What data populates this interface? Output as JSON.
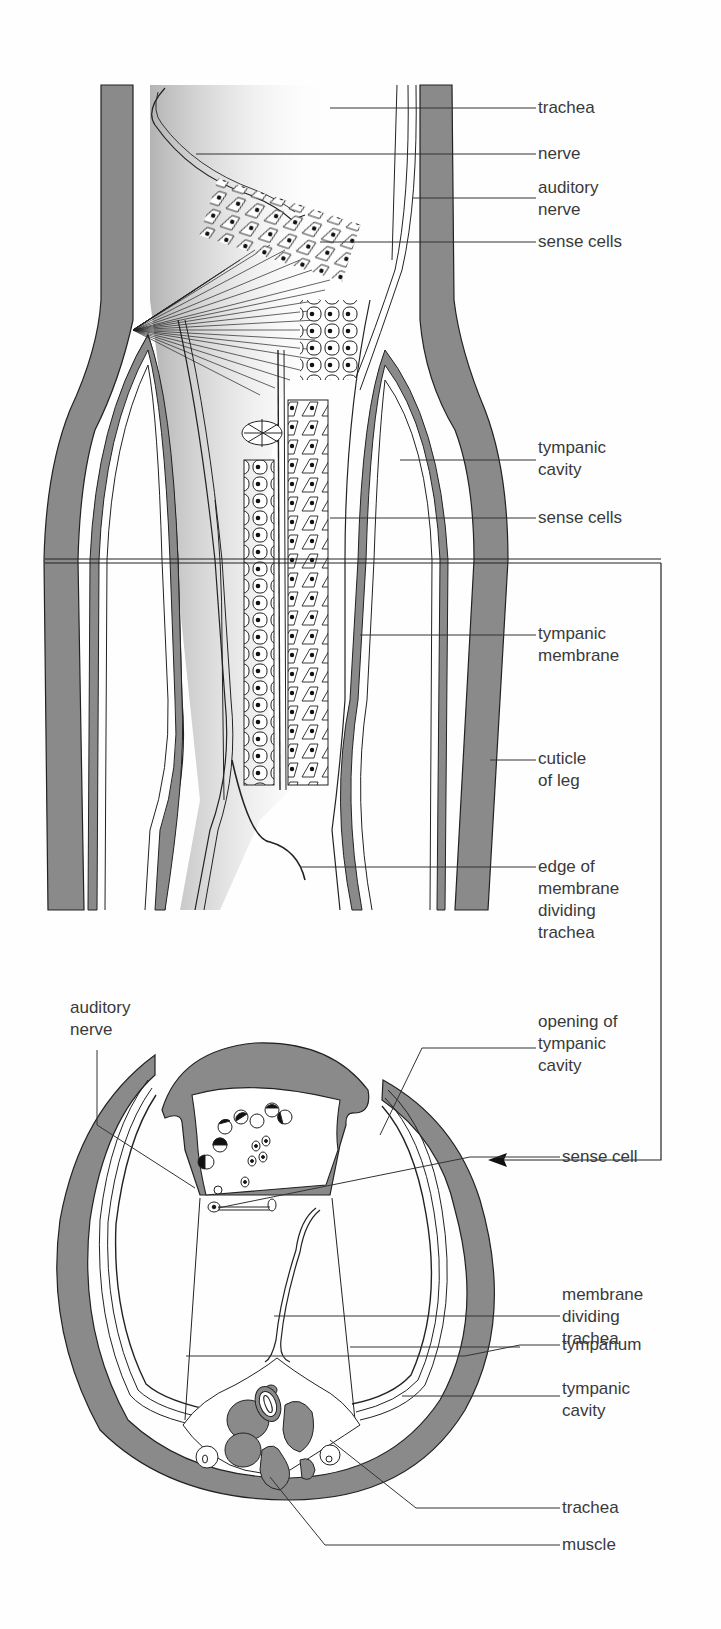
{
  "figure": {
    "views": [
      {
        "name": "longitudinal-section",
        "description": "Longitudinal section through insect leg tympanal organ"
      },
      {
        "name": "cross-section",
        "description": "Transverse section at the level indicated by the arrow"
      }
    ],
    "colors": {
      "cuticle": "#8a8a8a",
      "line": "#2a2a2a",
      "text": "#3a3a3a",
      "background": "#fefefe",
      "shading": "#bdbdbd"
    }
  },
  "labels": [
    {
      "id": "trachea-top",
      "text": "trachea",
      "x": 538,
      "y": 97,
      "leader": {
        "x1": 330,
        "y1": 108,
        "x2": 536,
        "y2": 108
      }
    },
    {
      "id": "nerve",
      "text": "nerve",
      "x": 538,
      "y": 143,
      "leader": {
        "x1": 196,
        "y1": 154,
        "x2": 536,
        "y2": 154
      }
    },
    {
      "id": "auditory-nerve-top",
      "text": "auditory\nnerve",
      "x": 538,
      "y": 177,
      "leader": {
        "x1": 413,
        "y1": 198,
        "x2": 536,
        "y2": 198
      }
    },
    {
      "id": "sense-cells-top",
      "text": "sense cells",
      "x": 538,
      "y": 231,
      "leader": {
        "x1": 320,
        "y1": 242,
        "x2": 536,
        "y2": 242
      }
    },
    {
      "id": "tympanic-cavity-top",
      "text": "tympanic\ncavity",
      "x": 538,
      "y": 437,
      "leader": {
        "x1": 400,
        "y1": 460,
        "x2": 536,
        "y2": 460
      }
    },
    {
      "id": "sense-cells-mid",
      "text": "sense cells",
      "x": 538,
      "y": 507,
      "leader": {
        "x1": 330,
        "y1": 518,
        "x2": 536,
        "y2": 518
      }
    },
    {
      "id": "tympanic-membrane",
      "text": "tympanic\nmembrane",
      "x": 538,
      "y": 623,
      "leader": {
        "x1": 360,
        "y1": 635,
        "x2": 536,
        "y2": 635
      }
    },
    {
      "id": "cuticle-of-leg",
      "text": "cuticle\nof leg",
      "x": 538,
      "y": 730,
      "leader": {
        "x1": 490,
        "y1": 760,
        "x2": 536,
        "y2": 760
      }
    },
    {
      "id": "edge-of-membrane",
      "text": "edge of\nmembrane\ndividing\ntrachea",
      "x": 538,
      "y": 825,
      "leader": {
        "x1": 300,
        "y1": 867,
        "x2": 536,
        "y2": 867
      }
    },
    {
      "id": "opening-of-tympanic-cavity",
      "text": "opening of\ntympanic\ncavity",
      "x": 538,
      "y": 1011,
      "leader_points": "380,1135 422,1048 536,1048"
    },
    {
      "id": "sense-cell",
      "text": "sense cell",
      "x": 562,
      "y": 1128,
      "leader_points": "218,1208 470,1157 560,1157"
    },
    {
      "id": "auditory-nerve-bottom",
      "text": "auditory\nnerve",
      "x": 70,
      "y": 967,
      "leader_points": "97,1050 97,1125 195,1188"
    },
    {
      "id": "membrane-dividing-trachea",
      "text": "membrane\ndividing\ntrachea",
      "x": 562,
      "y": 1248,
      "leader": {
        "x1": 274,
        "y1": 1316,
        "x2": 560,
        "y2": 1316
      }
    },
    {
      "id": "tympanum",
      "text": "tympanum",
      "x": 562,
      "y": 1333,
      "leader_points": "186,1356 465,1356 520,1345 560,1345",
      "leader2_points": "350,1347 520,1347"
    },
    {
      "id": "tympanic-cavity-bottom",
      "text": "tympanic\ncavity",
      "x": 562,
      "y": 1378,
      "leader": {
        "x1": 402,
        "y1": 1396,
        "x2": 560,
        "y2": 1396
      }
    },
    {
      "id": "trachea-bottom",
      "text": "trachea",
      "x": 562,
      "y": 1437,
      "leader_points": "330,1440 416,1508 560,1508"
    },
    {
      "id": "muscle",
      "text": "muscle",
      "x": 562,
      "y": 1477,
      "leader_points": "270,1477 325,1545 560,1545"
    }
  ],
  "section_indicator": {
    "line_y": 560,
    "x_start": 45,
    "x_end": 661,
    "drop_to_y": 1160,
    "arrow_to_x": 508,
    "arrow_y": 1160
  }
}
